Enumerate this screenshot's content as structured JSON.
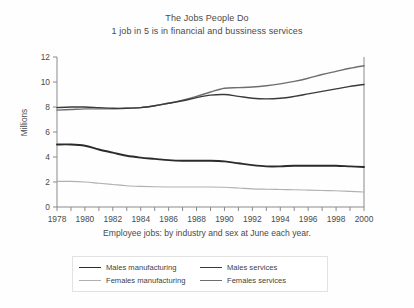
{
  "figure": {
    "title": "The Jobs People Do",
    "subtitle": "1 job in 5 is in financial and bussiness services",
    "caption": "Employee jobs: by industry and sex at June each year.",
    "background": "#fefefe",
    "text_color": "#4a4a4a"
  },
  "legend": {
    "entries": [
      {
        "label": "Males manufacturing",
        "color": "#2b2b2b",
        "width": 1.9
      },
      {
        "label": "Males services",
        "color": "#3a3a3a",
        "width": 1.5
      },
      {
        "label": "Females manufacturing",
        "color": "#b0b0b0",
        "width": 1.2
      },
      {
        "label": "Females services",
        "color": "#6e6e6e",
        "width": 1.3
      }
    ]
  },
  "chart_data": {
    "type": "line",
    "title": "The Jobs People Do",
    "subtitle": "1 job in 5 is in financial and bussiness services",
    "xlabel": "Employee jobs: by industry and sex at June each year.",
    "ylabel": "Millions",
    "xlim": [
      1978,
      2000
    ],
    "ylim": [
      0,
      12
    ],
    "yticks": [
      0,
      2,
      4,
      6,
      8,
      10,
      12
    ],
    "xticks": [
      1978,
      1979,
      1980,
      1981,
      1982,
      1983,
      1984,
      1985,
      1986,
      1987,
      1988,
      1989,
      1990,
      1991,
      1992,
      1993,
      1994,
      1995,
      1996,
      1997,
      1998,
      1999,
      2000
    ],
    "xtick_labels": [
      "1978",
      "",
      "1980",
      "",
      "1982",
      "",
      "1984",
      "",
      "1986",
      "",
      "1988",
      "",
      "1990",
      "",
      "1992",
      "",
      "1994",
      "",
      "1996",
      "",
      "1998",
      "",
      "2000"
    ],
    "grid": false,
    "legend_position": "below",
    "x": [
      1978,
      1979,
      1980,
      1981,
      1982,
      1983,
      1984,
      1985,
      1986,
      1987,
      1988,
      1989,
      1990,
      1991,
      1992,
      1993,
      1994,
      1995,
      1996,
      1997,
      1998,
      1999,
      2000
    ],
    "series": [
      {
        "name": "Females services",
        "color": "#6e6e6e",
        "values": [
          7.75,
          7.8,
          7.85,
          7.85,
          7.85,
          7.9,
          7.95,
          8.1,
          8.3,
          8.55,
          8.85,
          9.2,
          9.5,
          9.55,
          9.6,
          9.7,
          9.85,
          10.05,
          10.3,
          10.6,
          10.85,
          11.1,
          11.3
        ]
      },
      {
        "name": "Males services",
        "color": "#3a3a3a",
        "values": [
          7.95,
          8.0,
          8.0,
          7.95,
          7.9,
          7.9,
          7.95,
          8.1,
          8.3,
          8.5,
          8.75,
          8.95,
          9.0,
          8.85,
          8.7,
          8.65,
          8.7,
          8.85,
          9.05,
          9.25,
          9.45,
          9.65,
          9.8
        ]
      },
      {
        "name": "Males manufacturing",
        "color": "#2b2b2b",
        "values": [
          5.0,
          5.0,
          4.9,
          4.6,
          4.35,
          4.1,
          3.95,
          3.85,
          3.75,
          3.7,
          3.7,
          3.7,
          3.65,
          3.5,
          3.35,
          3.25,
          3.25,
          3.3,
          3.3,
          3.3,
          3.3,
          3.25,
          3.2
        ]
      },
      {
        "name": "Females manufacturing",
        "color": "#b0b0b0",
        "values": [
          2.05,
          2.05,
          2.0,
          1.9,
          1.8,
          1.7,
          1.65,
          1.62,
          1.6,
          1.6,
          1.6,
          1.6,
          1.58,
          1.52,
          1.45,
          1.42,
          1.4,
          1.38,
          1.35,
          1.32,
          1.3,
          1.25,
          1.2
        ]
      }
    ]
  }
}
